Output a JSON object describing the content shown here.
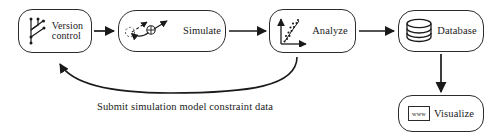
{
  "diagram": {
    "type": "workflow-flowchart",
    "orientation": "left-to-right-with-feedback-loop",
    "background_color": "#ffffff",
    "stroke_color": "#2b2b2b",
    "text_color": "#1a1a1a",
    "nodes": [
      {
        "id": "version-control",
        "label": "Version\ncontrol",
        "icon": "git-branch-icon",
        "shape": "rounded-rectangle"
      },
      {
        "id": "simulate",
        "label": "Simulate",
        "icon": "particle-trajectory-icon",
        "shape": "rounded-rectangle"
      },
      {
        "id": "analyze",
        "label": "Analyze",
        "icon": "scatter-plot-icon",
        "shape": "rounded-rectangle"
      },
      {
        "id": "database",
        "label": "Database",
        "icon": "database-cylinder-icon",
        "shape": "rounded-rectangle"
      },
      {
        "id": "visualize",
        "label": "Visualize",
        "icon": "www-browser-icon",
        "icon_text": "www",
        "shape": "rounded-rectangle"
      }
    ],
    "connectors": [
      {
        "id": "version-control-to-simulate",
        "from": "version-control",
        "to": "simulate",
        "style": "straight-arrow",
        "label": ""
      },
      {
        "id": "simulate-to-analyze",
        "from": "simulate",
        "to": "analyze",
        "style": "straight-arrow",
        "label": ""
      },
      {
        "id": "analyze-to-database",
        "from": "analyze",
        "to": "database",
        "style": "straight-arrow",
        "label": ""
      },
      {
        "id": "database-to-visualize",
        "from": "database",
        "to": "visualize",
        "style": "straight-arrow-down",
        "label": ""
      },
      {
        "id": "analyze-to-version-control",
        "from": "analyze",
        "to": "version-control",
        "style": "curved-feedback-arrow",
        "label": "Submit simulation model constraint data"
      }
    ],
    "caption": "Submit simulation model constraint data"
  }
}
